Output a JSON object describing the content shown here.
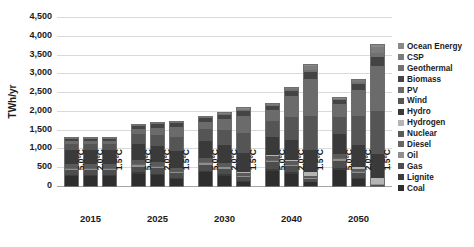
{
  "chart_data": {
    "type": "bar",
    "title": "",
    "subtitle": "",
    "xlabel": "",
    "ylabel": "TWh/yr",
    "ylim": [
      0,
      4500
    ],
    "ytick_step": 500,
    "ytick_labels": [
      "4,500",
      "4,000",
      "3,500",
      "3,000",
      "2,500",
      "2,000",
      "1,500",
      "1,000",
      "500",
      "0"
    ],
    "ytick_values": [
      4500,
      4000,
      3500,
      3000,
      2500,
      2000,
      1500,
      1000,
      500,
      0
    ],
    "grid": true,
    "stacked": true,
    "legend_position": "right",
    "group_labels": [
      "2015",
      "2025",
      "2030",
      "2040",
      "2050"
    ],
    "scenario_labels": [
      "5.0°C",
      "2.0°C",
      "1.5°C"
    ],
    "categories": [
      "2015 5.0°C",
      "2015 2.0°C",
      "2015 1.5°C",
      "2025 5.0°C",
      "2025 2.0°C",
      "2025 1.5°C",
      "2030 5.0°C",
      "2030 2.0°C",
      "2030 1.5°C",
      "2040 5.0°C",
      "2040 2.0°C",
      "2040 1.5°C",
      "2050 5.0°C",
      "2050 2.0°C",
      "2050 1.5°C"
    ],
    "totals": [
      1270,
      1270,
      1270,
      1620,
      1670,
      1700,
      1840,
      1930,
      2080,
      2260,
      2760,
      3520,
      2700,
      3080,
      3800
    ],
    "series": [
      {
        "name": "Coal",
        "color": "#2e2e2e",
        "values": [
          270,
          270,
          270,
          330,
          300,
          200,
          360,
          280,
          120,
          400,
          330,
          100,
          430,
          200,
          0
        ]
      },
      {
        "name": "Lignite",
        "color": "#3c3c3c",
        "values": [
          30,
          30,
          30,
          35,
          30,
          20,
          38,
          28,
          12,
          40,
          30,
          10,
          42,
          20,
          0
        ]
      },
      {
        "name": "Gas",
        "color": "#4d4d4d",
        "values": [
          120,
          120,
          120,
          150,
          140,
          120,
          170,
          150,
          110,
          190,
          160,
          90,
          200,
          130,
          40
        ]
      },
      {
        "name": "Oil",
        "color": "#8f8f8f",
        "values": [
          40,
          40,
          40,
          42,
          38,
          30,
          44,
          36,
          22,
          46,
          34,
          14,
          48,
          24,
          4
        ]
      },
      {
        "name": "Diesel",
        "color": "#666666",
        "values": [
          20,
          20,
          20,
          22,
          20,
          16,
          24,
          20,
          12,
          26,
          18,
          8,
          28,
          14,
          2
        ]
      },
      {
        "name": "Nuclear",
        "color": "#5a5a5a",
        "values": [
          110,
          110,
          110,
          110,
          105,
          95,
          110,
          100,
          80,
          110,
          90,
          50,
          110,
          70,
          20
        ]
      },
      {
        "name": "Hydrogen",
        "color": "#b5b5b5",
        "values": [
          0,
          0,
          0,
          0,
          4,
          10,
          0,
          10,
          30,
          2,
          30,
          90,
          4,
          60,
          160
        ]
      },
      {
        "name": "Hydro",
        "color": "#3a3a3a",
        "values": [
          380,
          380,
          380,
          420,
          430,
          450,
          450,
          470,
          500,
          500,
          540,
          600,
          520,
          580,
          640
        ]
      },
      {
        "name": "Wind",
        "color": "#555555",
        "values": [
          160,
          160,
          160,
          270,
          300,
          360,
          330,
          400,
          520,
          430,
          620,
          900,
          470,
          760,
          1130
        ]
      },
      {
        "name": "PV",
        "color": "#6b6b6b",
        "values": [
          60,
          60,
          60,
          140,
          190,
          260,
          190,
          290,
          450,
          290,
          550,
          980,
          330,
          700,
          1200
        ]
      },
      {
        "name": "Biomass",
        "color": "#444444",
        "values": [
          70,
          70,
          70,
          90,
          100,
          120,
          100,
          115,
          150,
          110,
          140,
          200,
          115,
          165,
          250
        ]
      },
      {
        "name": "Geothermal",
        "color": "#717171",
        "values": [
          8,
          8,
          8,
          12,
          14,
          18,
          16,
          20,
          30,
          20,
          32,
          60,
          22,
          42,
          90
        ]
      },
      {
        "name": "CSP",
        "color": "#7c7c7c",
        "values": [
          2,
          2,
          2,
          6,
          8,
          14,
          8,
          14,
          30,
          12,
          32,
          100,
          14,
          55,
          180
        ]
      },
      {
        "name": "Ocean Energy",
        "color": "#8a8a8a",
        "values": [
          0,
          0,
          0,
          1,
          1,
          2,
          2,
          3,
          6,
          4,
          8,
          24,
          5,
          14,
          40
        ]
      }
    ]
  },
  "legend": {
    "items": [
      {
        "label": "Ocean Energy",
        "color": "#8a8a8a"
      },
      {
        "label": "CSP",
        "color": "#7c7c7c"
      },
      {
        "label": "Geothermal",
        "color": "#717171"
      },
      {
        "label": "Biomass",
        "color": "#444444"
      },
      {
        "label": "PV",
        "color": "#6b6b6b"
      },
      {
        "label": "Wind",
        "color": "#555555"
      },
      {
        "label": "Hydro",
        "color": "#3a3a3a"
      },
      {
        "label": "Hydrogen",
        "color": "#b5b5b5"
      },
      {
        "label": "Nuclear",
        "color": "#5a5a5a"
      },
      {
        "label": "Diesel",
        "color": "#666666"
      },
      {
        "label": "Oil",
        "color": "#8f8f8f"
      },
      {
        "label": "Gas",
        "color": "#4d4d4d"
      },
      {
        "label": "Lignite",
        "color": "#3c3c3c"
      },
      {
        "label": "Coal",
        "color": "#2e2e2e"
      }
    ]
  },
  "caption": {
    "text": ""
  }
}
